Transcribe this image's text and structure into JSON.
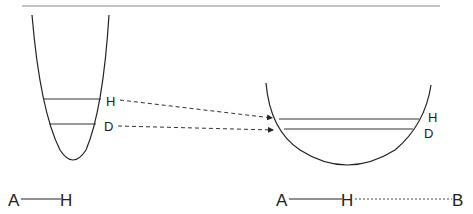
{
  "diagram": {
    "left_well": {
      "levels": [
        {
          "label": "H"
        },
        {
          "label": "D"
        }
      ],
      "bond": {
        "atom1": "A",
        "atom2": "H"
      }
    },
    "right_well": {
      "levels": [
        {
          "label": "H"
        },
        {
          "label": "D"
        }
      ],
      "bond": {
        "atom1": "A",
        "atom2": "H",
        "atom3": "B"
      }
    },
    "colors": {
      "line": "#222222",
      "rule": "#888888"
    }
  }
}
